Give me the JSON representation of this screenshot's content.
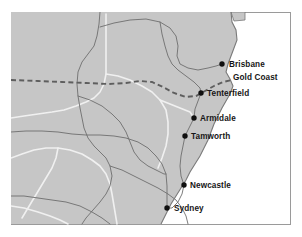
{
  "figure": {
    "type": "map",
    "title": "",
    "width": 302,
    "height": 237,
    "frame": {
      "x": 11,
      "y": 12,
      "width": 279,
      "height": 212
    }
  },
  "colors": {
    "page_background": "#ffffff",
    "land": "#c6c6c6",
    "ocean": "#ffffff",
    "frame_border": "#9a9a9a",
    "road_primary": "#6e6e6e",
    "road_secondary": "#f0f0f0",
    "coastline": "#7a7a7a",
    "state_border_dashed": "#5e5e5e",
    "city_marker": "#101010",
    "label_text": "#161616"
  },
  "legend_hint": {
    "dashed_line_meaning": "state border",
    "white_line_meaning": "highway",
    "gray_line_meaning": "road"
  },
  "cities": [
    {
      "name": "Brisbane",
      "marker": true,
      "cx": 222,
      "cy": 64,
      "label_x": 229,
      "label_y": 67,
      "anchor": "start"
    },
    {
      "name": "Gold Coast",
      "marker": false,
      "cx": 228,
      "cy": 77,
      "label_x": 233,
      "label_y": 80,
      "anchor": "start"
    },
    {
      "name": "Tenterfield",
      "marker": true,
      "cx": 201,
      "cy": 93,
      "label_x": 207,
      "label_y": 96,
      "anchor": "start"
    },
    {
      "name": "Armidale",
      "marker": true,
      "cx": 194,
      "cy": 118,
      "label_x": 200,
      "label_y": 121,
      "anchor": "start"
    },
    {
      "name": "Tamworth",
      "marker": true,
      "cx": 185,
      "cy": 136,
      "label_x": 191,
      "label_y": 139,
      "anchor": "start"
    },
    {
      "name": "Newcastle",
      "marker": true,
      "cx": 184,
      "cy": 185,
      "label_x": 190,
      "label_y": 188,
      "anchor": "start"
    },
    {
      "name": "Sydney",
      "marker": true,
      "cx": 167,
      "cy": 208,
      "label_x": 174,
      "label_y": 211,
      "anchor": "start"
    }
  ],
  "geometry": {
    "land_polygon": "M11,12 L231,12 L232,22 L236,30 L237,40 L234,48 L231,56 L228,64 L226,72 L230,79 L233,86 L230,94 L226,101 L222,108 L218,116 L214,124 L211,132 L208,140 L204,148 L200,156 L195,164 L190,172 L186,180 L181,188 L176,196 L171,204 L167,212 L163,220 L161,224 L11,224 Z",
    "coastline": "M231,12 L232,22 L236,30 L237,40 L234,48 L231,56 L228,64 L226,72 L230,79 L233,86 L230,94 L226,101 L222,108 L218,116 L214,124 L211,132 L208,140 L204,148 L200,156 L195,164 L190,172 L186,180 L181,188 L176,196 L171,204 L167,212 L163,220 L161,224",
    "state_border_dashed": "M11,80 L38,81 L62,82 L86,83 L108,84 L126,83 L140,81 L152,82 L163,87 L174,93 L186,97 L196,96 L205,91 L214,86 L223,82 L232,80",
    "roads_primary": [
      "M100,12 L99,24 L97,36 L94,46 L88,54 L82,62 L78,72 L77,84 L78,96 L80,108 L82,118 L84,128 L88,138 L94,146 L100,152 L106,158 L110,166 L112,176 L110,186 L106,194 L100,202 L93,210 L86,218 L82,224",
      "M100,27 L114,23 L130,20 L146,19 L160,22 L170,28 L176,36 L178,46 L177,56 L180,64 L188,68 L198,70 L208,68 L216,66 L222,64",
      "M160,22 L162,34 L165,46 L168,56 L172,64 L178,70 L186,76 L194,82 L200,88 L201,93",
      "M11,132 L26,131 L42,131 L58,132 L72,134 L86,135 L100,135 L114,136 L126,138 L138,142 L148,148 L156,156 L162,164 L166,174 L167,186 L167,196 L167,208",
      "M110,166 L122,170 L134,176 L146,182 L158,188 L168,194 L176,200 L182,208 L186,216 L188,224",
      "M201,93 L198,101 L195,109 L194,118 L190,126 L186,134 L185,136 L183,146 L181,156 L180,166 L181,176 L184,185 L182,194 L178,202 L172,208 L167,208",
      "M78,96 L90,100 L102,106 L112,114 L120,122 L126,132 L130,142 L134,152 L140,160 L148,166 L156,170 L164,174 L166,174",
      "M11,196 L24,196 L38,198 L52,200 L66,202 L80,206 L92,212 L102,218 L110,224"
    ],
    "roads_secondary": [
      "M11,118 L24,116 L38,114 L52,112 L64,110 L76,106 L86,102 L94,98 L100,92 L104,84 L106,74 L106,62 L106,50 L106,38 L106,26 L106,14",
      "M106,74 L118,76 L130,80 L142,86 L152,92 L160,100 L166,110 L168,122 L168,134 L166,146 L162,158 L158,168",
      "M11,158 L22,154 L34,150 L46,148 L58,148 L70,150 L82,154 L92,160 L100,166 L106,174 L110,184 L112,194 L114,206 L116,218 L117,224",
      "M58,148 L56,158 L52,168 L46,178 L40,188 L34,198 L28,208 L22,218",
      "M160,100 L170,104 L180,108 L190,112 L194,118",
      "M11,206 L24,208 L38,212 L50,216 L60,220 L68,224"
    ],
    "ocean_islands": [
      "M231,12 L245,12 L245,20 L234,21 Z"
    ]
  }
}
